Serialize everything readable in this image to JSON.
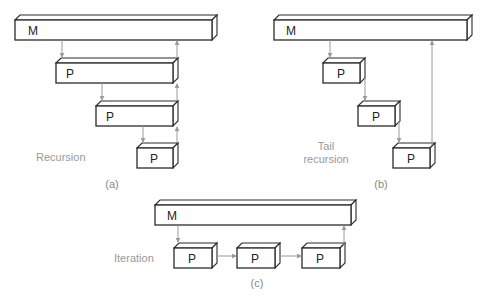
{
  "panels": {
    "a": {
      "caption": "Recursion",
      "label": "(a)",
      "boxes": [
        {
          "label": "M"
        },
        {
          "label": "P"
        },
        {
          "label": "P"
        },
        {
          "label": "P"
        }
      ]
    },
    "b": {
      "caption_line1": "Tail",
      "caption_line2": "recursion",
      "label": "(b)",
      "boxes": [
        {
          "label": "M"
        },
        {
          "label": "P"
        },
        {
          "label": "P"
        },
        {
          "label": "P"
        }
      ]
    },
    "c": {
      "caption": "Iteration",
      "label": "(c)",
      "boxes": [
        {
          "label": "M"
        },
        {
          "label": "P"
        },
        {
          "label": "P"
        },
        {
          "label": "P"
        }
      ]
    }
  },
  "colors": {
    "box_stroke": "#2a2a2a",
    "arrow": "#9a9a9a",
    "caption_text": "#999999"
  }
}
